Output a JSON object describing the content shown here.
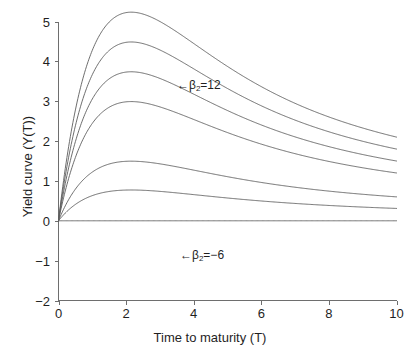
{
  "figure": {
    "background_color": "#ffffff",
    "line_color": "#5d5d5d",
    "axis_color": "#6e6e6e"
  },
  "axes": {
    "x_title": "Time to maturity (T)",
    "y_title": "Yield curve (Y(T))",
    "x_ticks": [
      "0",
      "2",
      "4",
      "6",
      "8",
      "10"
    ],
    "y_ticks": [
      "5",
      "4",
      "3",
      "2",
      "1",
      "0",
      "-1",
      "-2"
    ]
  },
  "annotations": {
    "top": {
      "arrow": "←",
      "beta": "β",
      "sub": "2",
      "value": "=12"
    },
    "bottom": {
      "arrow": "←",
      "beta": "β",
      "sub": "2",
      "value": "=−6"
    }
  },
  "chart_data": {
    "type": "line",
    "title": "",
    "xlabel": "Time to maturity (T)",
    "ylabel": "Yield curve (Y(T))",
    "xlim": [
      0,
      10
    ],
    "ylim": [
      -2,
      5
    ],
    "xticks": [
      0,
      2,
      4,
      6,
      8,
      10
    ],
    "yticks": [
      -2,
      -1,
      0,
      1,
      2,
      3,
      4,
      5
    ],
    "grid": false,
    "legend": "none",
    "annotations": [
      {
        "text": "← β₂=12",
        "x": 4.0,
        "y": 3.45,
        "points_to_series": "beta2=12"
      },
      {
        "text": "← β₂=−6",
        "x": 4.05,
        "y": -0.7,
        "points_to_series": "beta2=-6"
      }
    ],
    "model": {
      "name": "Nelson-Siegel yield curve",
      "formula": "Y(T) = b0 + b1*(1-exp(-T/tau))/(T/tau) + b2*((1-exp(-T/tau))/(T/tau) - exp(-T/tau))",
      "beta0": 0,
      "beta1": 0,
      "tau": 1.2
    },
    "x": [
      0,
      0.1,
      0.2,
      0.3,
      0.4,
      0.5,
      0.7,
      0.9,
      1.1,
      1.3,
      1.5,
      1.75,
      2,
      2.25,
      2.5,
      2.75,
      3,
      3.5,
      4,
      4.5,
      5,
      5.5,
      6,
      6.5,
      7,
      7.5,
      8,
      8.5,
      9,
      9.5,
      10
    ],
    "series": [
      {
        "name": "beta2=12",
        "beta2": 12,
        "values": [
          0,
          0.47,
          0.9,
          1.29,
          1.65,
          1.98,
          2.54,
          3.0,
          3.37,
          3.66,
          3.88,
          4.06,
          4.13,
          4.13,
          4.08,
          4.0,
          3.9,
          3.66,
          3.41,
          3.18,
          2.96,
          2.77,
          2.6,
          2.45,
          2.33,
          2.24,
          2.19,
          2.15,
          2.13,
          2.11,
          2.1
        ],
        "endpoint_at_10": 2.1,
        "peak": {
          "x": 2.0,
          "y": 4.13
        }
      },
      {
        "name": "beta2=9",
        "beta2": 9,
        "values": [
          0,
          0.36,
          0.68,
          0.97,
          1.24,
          1.49,
          1.91,
          2.25,
          2.53,
          2.75,
          2.91,
          3.05,
          3.1,
          3.1,
          3.06,
          3.0,
          2.93,
          2.75,
          2.56,
          2.39,
          2.22,
          2.08,
          1.95,
          1.84,
          1.75,
          1.68,
          1.64,
          1.62,
          1.6,
          1.59,
          1.58
        ],
        "endpoint_at_10": 1.8,
        "peak": {
          "x": 2.05,
          "y": 3.22
        }
      },
      {
        "name": "beta2=6",
        "beta2": 6,
        "values": [
          0,
          0.24,
          0.45,
          0.65,
          0.83,
          0.99,
          1.27,
          1.5,
          1.68,
          1.83,
          1.94,
          2.03,
          2.07,
          2.07,
          2.04,
          2.0,
          1.95,
          1.83,
          1.7,
          1.59,
          1.48,
          1.39,
          1.3,
          1.23,
          1.17,
          1.12,
          1.09,
          1.08,
          1.07,
          1.06,
          1.05
        ],
        "endpoint_at_10": 1.5,
        "peak": {
          "x": 2.25,
          "y": 2.36
        }
      },
      {
        "name": "beta2=3",
        "beta2": 3,
        "values": [
          0,
          0.12,
          0.23,
          0.32,
          0.41,
          0.5,
          0.64,
          0.75,
          0.84,
          0.92,
          0.97,
          1.02,
          1.03,
          1.03,
          1.02,
          1.0,
          0.98,
          0.92,
          0.85,
          0.8,
          0.74,
          0.69,
          0.65,
          0.61,
          0.58,
          0.56,
          0.55,
          0.54,
          0.53,
          0.53,
          0.53
        ],
        "endpoint_at_10": 1.2,
        "peak": {
          "x": 2.5,
          "y": 1.48
        }
      },
      {
        "name": "beta2=0",
        "beta2": 0,
        "values": [
          0,
          0.09,
          0.18,
          0.26,
          0.34,
          0.41,
          0.53,
          0.63,
          0.7,
          0.76,
          0.8,
          0.83,
          0.85,
          0.86,
          0.87,
          0.87,
          0.88,
          0.88,
          0.88,
          0.89,
          0.89,
          0.89,
          0.89,
          0.9,
          0.9,
          0.9,
          0.9,
          0.9,
          0.9,
          0.9,
          0.9
        ],
        "endpoint_at_10": 0.9,
        "peak": null
      },
      {
        "name": "beta2=-3",
        "beta2": -3,
        "values": [
          0,
          -0.12,
          -0.23,
          -0.32,
          -0.41,
          -0.44,
          -0.46,
          -0.45,
          -0.43,
          -0.4,
          -0.36,
          -0.31,
          -0.25,
          -0.19,
          -0.13,
          -0.07,
          -0.01,
          0.09,
          0.18,
          0.26,
          0.32,
          0.38,
          0.43,
          0.47,
          0.51,
          0.54,
          0.56,
          0.58,
          0.59,
          0.6,
          0.6
        ],
        "endpoint_at_10": 0.6,
        "trough": {
          "x": 0.85,
          "y": -0.45
        }
      },
      {
        "name": "beta2=-6",
        "beta2": -6,
        "values": [
          0,
          -0.33,
          -0.6,
          -0.82,
          -0.99,
          -1.11,
          -1.25,
          -1.3,
          -1.31,
          -1.3,
          -1.28,
          -1.22,
          -1.14,
          -1.05,
          -0.96,
          -0.87,
          -0.78,
          -0.61,
          -0.46,
          -0.32,
          -0.2,
          -0.1,
          -0.01,
          0.06,
          0.13,
          0.18,
          0.22,
          0.25,
          0.28,
          0.3,
          0.31
        ],
        "endpoint_at_10": 0.31,
        "trough": {
          "x": 1.45,
          "y": -1.31
        }
      }
    ]
  }
}
